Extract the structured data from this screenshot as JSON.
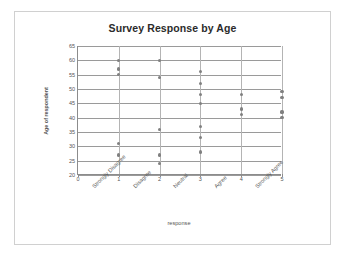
{
  "chart_data": {
    "type": "scatter",
    "title": "Survey Response by Age",
    "xlabel": "response",
    "ylabel": "Age of respondent",
    "xlim": [
      0,
      5
    ],
    "ylim": [
      20,
      65
    ],
    "grid": true,
    "legend": "none",
    "x_ticks": [
      "0",
      "1",
      "2",
      "3",
      "4",
      "5"
    ],
    "y_ticks": [
      "20",
      "25",
      "30",
      "35",
      "40",
      "45",
      "50",
      "55",
      "60",
      "65"
    ],
    "categories": [
      {
        "value": 1,
        "label": "Strongly Disagree"
      },
      {
        "value": 2,
        "label": "Disagree"
      },
      {
        "value": 3,
        "label": "Neutral"
      },
      {
        "value": 4,
        "label": "Agree"
      },
      {
        "value": 5,
        "label": "Strongly Agree"
      }
    ],
    "points": [
      {
        "x": 1,
        "y": 60
      },
      {
        "x": 1,
        "y": 57
      },
      {
        "x": 1,
        "y": 55
      },
      {
        "x": 1,
        "y": 31
      },
      {
        "x": 1,
        "y": 27
      },
      {
        "x": 2,
        "y": 60
      },
      {
        "x": 2,
        "y": 54
      },
      {
        "x": 2,
        "y": 36
      },
      {
        "x": 2,
        "y": 27
      },
      {
        "x": 2,
        "y": 24
      },
      {
        "x": 3,
        "y": 56
      },
      {
        "x": 3,
        "y": 52
      },
      {
        "x": 3,
        "y": 48
      },
      {
        "x": 3,
        "y": 45
      },
      {
        "x": 3,
        "y": 37
      },
      {
        "x": 3,
        "y": 33
      },
      {
        "x": 3,
        "y": 28
      },
      {
        "x": 4,
        "y": 48
      },
      {
        "x": 4,
        "y": 43
      },
      {
        "x": 4,
        "y": 41
      },
      {
        "x": 5,
        "y": 49
      },
      {
        "x": 5,
        "y": 47
      },
      {
        "x": 5,
        "y": 42
      },
      {
        "x": 5,
        "y": 40
      }
    ],
    "marker_color": "#808080",
    "grid_color": "#9a9a9a",
    "axis_color": "#8c8c8c"
  }
}
